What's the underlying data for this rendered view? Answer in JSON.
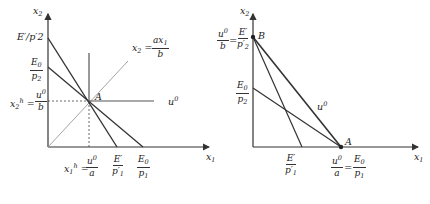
{
  "left_diagram": {
    "axes": {
      "y_label": "x2",
      "x_label": "x1"
    },
    "labels": {
      "E_prime_over_p2_prime": "E′/p′2",
      "E0_over_p2": {
        "num": "E0",
        "den": "p2"
      },
      "x2h": {
        "lhs": "x2h",
        "num": "u0",
        "den": "b"
      },
      "x1h": {
        "lhs": "x1h",
        "num": "u0",
        "den": "a"
      },
      "E_prime_over_p1_prime": {
        "num": "E′",
        "den": "p′1"
      },
      "E0_over_p1": {
        "num": "E0",
        "den": "p1"
      },
      "ray": {
        "lhs": "x2 =",
        "num": "ax1",
        "den": "b"
      },
      "point_A": "A",
      "indifference": "u0"
    }
  },
  "right_diagram": {
    "axes": {
      "y_label": "x2",
      "x_label": "x1"
    },
    "labels": {
      "B_intercept": {
        "num1": "u0",
        "den1": "b",
        "num2": "E′",
        "den2": "p′2"
      },
      "E0_over_p2": {
        "num": "E0",
        "den": "p2"
      },
      "E_prime_over_p1_prime": {
        "num": "E′",
        "den": "p′1"
      },
      "A_intercept": {
        "num1": "u0",
        "den1": "a",
        "num2": "E0",
        "den2": "p1"
      },
      "point_A": "A",
      "point_B": "B",
      "indifference": "u0"
    }
  },
  "colors": {
    "line": "#333333",
    "light_line": "#8a8a8a",
    "text": "#222222"
  }
}
